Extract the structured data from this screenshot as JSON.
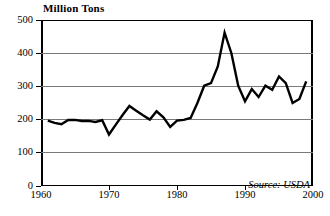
{
  "chart_data": {
    "type": "line",
    "title": "",
    "ylabel": "Million Tons",
    "xlabel": "",
    "ylim": [
      0,
      500
    ],
    "xlim": [
      1960,
      2000
    ],
    "yticks": [
      0,
      100,
      200,
      300,
      400,
      500
    ],
    "xticks": [
      1960,
      1970,
      1980,
      1990,
      2000
    ],
    "grid": true,
    "legend": null,
    "annotation": "Source: USDA",
    "x": [
      1961,
      1962,
      1963,
      1964,
      1965,
      1966,
      1967,
      1968,
      1969,
      1970,
      1971,
      1972,
      1973,
      1974,
      1975,
      1976,
      1977,
      1978,
      1979,
      1980,
      1981,
      1982,
      1983,
      1984,
      1985,
      1986,
      1987,
      1988,
      1989,
      1990,
      1991,
      1992,
      1993,
      1994,
      1995,
      1996,
      1997,
      1998,
      1999
    ],
    "values": [
      197,
      190,
      186,
      199,
      199,
      196,
      196,
      193,
      198,
      155,
      185,
      214,
      241,
      227,
      213,
      200,
      225,
      207,
      178,
      197,
      199,
      205,
      250,
      302,
      310,
      360,
      462,
      400,
      302,
      255,
      292,
      268,
      302,
      290,
      330,
      310,
      250,
      262,
      315
    ],
    "ytick_labels": [
      "0",
      "100",
      "200",
      "300",
      "400",
      "500"
    ],
    "xtick_labels": [
      "1960",
      "1970",
      "1980",
      "1990",
      "2000"
    ]
  },
  "labels": {
    "y_axis_title": "Million Tons",
    "source": "Source: USDA"
  }
}
